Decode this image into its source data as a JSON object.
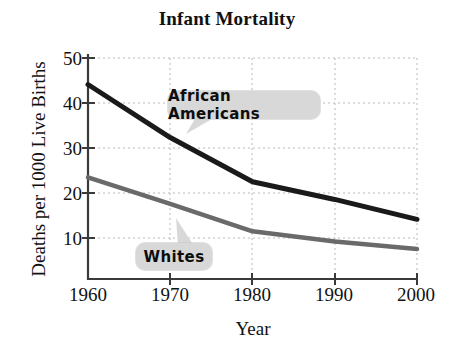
{
  "chart_data": {
    "type": "line",
    "title": "Infant Mortality",
    "xlabel": "Year",
    "ylabel": "Deaths per 1000 Live Births",
    "x": [
      1960,
      1970,
      1980,
      1990,
      2000
    ],
    "xtick_labels": [
      "1960",
      "1970",
      "1980",
      "1990",
      "2000"
    ],
    "ytick_labels": [
      "10",
      "20",
      "30",
      "40",
      "50"
    ],
    "yticks": [
      10,
      20,
      30,
      40,
      50
    ],
    "xlim": [
      1960,
      2000
    ],
    "ylim": [
      0,
      50
    ],
    "grid": true,
    "grid_style": "dotted",
    "legend_position": "inline-callouts",
    "series": [
      {
        "name": "African Americans",
        "color": "#1a1a1a",
        "values": [
          44,
          32,
          22,
          18,
          13.5
        ]
      },
      {
        "name": "Whites",
        "color": "#6a6a6a",
        "values": [
          23,
          17,
          10.8,
          8.5,
          6.8
        ]
      }
    ],
    "annotations": [
      {
        "label": "African Americans",
        "points_to_series": "African Americans"
      },
      {
        "label": "Whites",
        "points_to_series": "Whites"
      }
    ]
  },
  "colors": {
    "african_americans": "#1a1a1a",
    "whites": "#6a6a6a",
    "callout_background": "#d8d8d8",
    "axis": "#3a3a3a",
    "grid": "#bbbbbb",
    "background": "#ffffff"
  }
}
